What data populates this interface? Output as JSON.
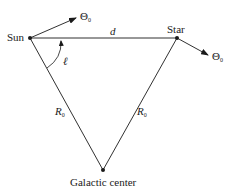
{
  "diagram": {
    "type": "geometry",
    "nodes": {
      "sun": {
        "label": "Sun",
        "x": 30,
        "y": 38
      },
      "star": {
        "label": "Star",
        "x": 177,
        "y": 38
      },
      "galactic_center": {
        "label": "Galactic center",
        "x": 103,
        "y": 170
      }
    },
    "edges": {
      "sun_star": {
        "label": "d",
        "from": "sun",
        "to": "star"
      },
      "sun_center": {
        "label_main": "R",
        "label_sub": "0",
        "from": "sun",
        "to": "galactic_center"
      },
      "star_center": {
        "label_main": "R",
        "label_sub": "0",
        "from": "star",
        "to": "galactic_center"
      }
    },
    "vectors": {
      "sun_velocity": {
        "label_main": "Θ",
        "label_sub": "0",
        "from": "sun"
      },
      "star_velocity": {
        "label_main": "Θ",
        "label_sub": "0",
        "from": "star"
      }
    },
    "angle": {
      "label": "ℓ",
      "vertex": "sun",
      "between": [
        "sun_center",
        "sun_star"
      ]
    },
    "colors": {
      "line": "#1a1a1a",
      "background": "#ffffff"
    }
  }
}
